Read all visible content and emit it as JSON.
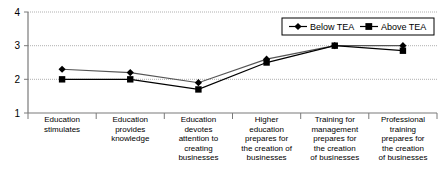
{
  "chart_data": {
    "type": "line",
    "title": "",
    "subtitle": "",
    "xlabel": "",
    "ylabel": "",
    "ylim": [
      1,
      4
    ],
    "yticks": [
      1,
      2,
      3,
      4
    ],
    "grid": true,
    "legend_position": "top-right",
    "categories": [
      "Education\nstimulates",
      "Education\nprovides\nknowledge",
      "Education\ndevotes\nattention to\ncreating\nbusinesses",
      "Higher\neducation\nprepares for\nthe creation of\nbusinesses",
      "Training for\nmanagement\nprepares for\nthe creation\nof businesses",
      "Professional\ntraining\nprepares for\nthe creation\nof businesses"
    ],
    "series": [
      {
        "name": "Below TEA",
        "marker": "diamond",
        "color": "#000000",
        "values": [
          2.3,
          2.2,
          1.9,
          2.6,
          3.0,
          3.0
        ]
      },
      {
        "name": "Above TEA",
        "marker": "square",
        "color": "#000000",
        "values": [
          2.0,
          2.0,
          1.7,
          2.5,
          3.0,
          2.85
        ]
      }
    ]
  },
  "axis": {
    "ytick_labels": [
      "4",
      "3",
      "2",
      "1"
    ]
  },
  "legend": {
    "items": [
      {
        "label": "Below TEA",
        "marker": "diamond"
      },
      {
        "label": "Above TEA",
        "marker": "square"
      }
    ]
  },
  "colors": {
    "axis": "#808080",
    "grid": "#b0b0b0",
    "series_below": "#555555",
    "series_above": "#000000",
    "marker": "#000000",
    "legend_border": "#000000",
    "background": "#ffffff"
  }
}
